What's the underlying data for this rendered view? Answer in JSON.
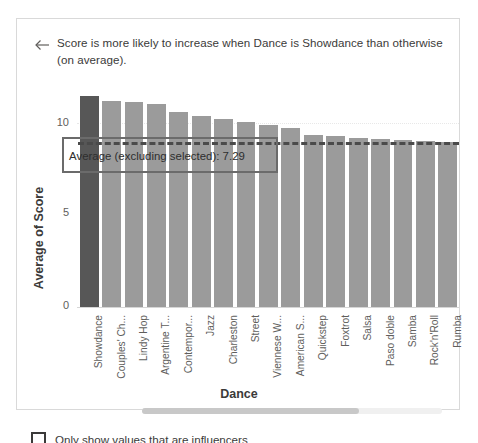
{
  "card": {
    "header": {
      "back_icon": "arrow-left-icon",
      "title": "Score is more likely to increase when Dance is Showdance than otherwise (on average)."
    },
    "footer": {
      "checkbox_label": "Only show values that are influencers",
      "checkbox_checked": false
    },
    "scrollbar": {
      "orientation": "horizontal"
    }
  },
  "colors": {
    "bar": "#9b9b9b",
    "bar_selected": "#575757",
    "average_line": "#4a4a4a",
    "callout_border": "#6b6b6b",
    "text": "#3b3a39"
  },
  "annotation": {
    "label": "Average (excluding selected): 7.29",
    "value": 7.29
  },
  "chart_data": {
    "type": "bar",
    "title": "",
    "xlabel": "Dance",
    "ylabel": "Average of Score",
    "ylim": [
      0,
      10
    ],
    "yticks": [
      0,
      5,
      10
    ],
    "ytick_labels": [
      "0",
      "5",
      "10"
    ],
    "grid": true,
    "legend": "none",
    "selected_category": "Showdance",
    "reference_line": {
      "label": "Average (excluding selected): 7.29",
      "value": 7.29,
      "style": "dashed"
    },
    "categories": [
      "Showdance",
      "Couples' Ch...",
      "Lindy Hop",
      "Argentine T...",
      "Contempor...",
      "Jazz",
      "Charleston",
      "Street",
      "Viennese W...",
      "American S...",
      "Quickstep",
      "Foxtrot",
      "Salsa",
      "Paso doble",
      "Samba",
      "Rock'n'Roll",
      "Rumba"
    ],
    "values": [
      9.35,
      9.12,
      9.05,
      8.98,
      8.65,
      8.45,
      8.3,
      8.2,
      8.05,
      7.9,
      7.6,
      7.55,
      7.5,
      7.45,
      7.4,
      7.35,
      7.3
    ]
  }
}
